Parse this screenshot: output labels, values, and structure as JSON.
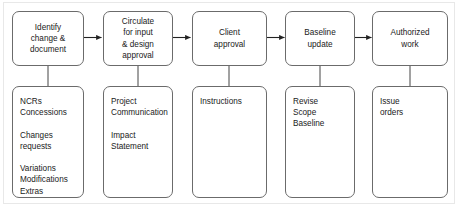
{
  "diagram": {
    "colors": {
      "box_border": "#6b6b6b",
      "connector": "#222222",
      "frame": "#e8e8e8",
      "text": "#1a1a1a",
      "background": "#ffffff"
    },
    "process_steps": [
      {
        "id": "step-1",
        "label": "Identify\nchange &\ndocument"
      },
      {
        "id": "step-2",
        "label": "Circulate\nfor input\n& design\napproval"
      },
      {
        "id": "step-3",
        "label": "Client\napproval"
      },
      {
        "id": "step-4",
        "label": "Baseline\nupdate"
      },
      {
        "id": "step-5",
        "label": "Authorized\nwork"
      }
    ],
    "detail_boxes": [
      {
        "id": "detail-1",
        "label": "NCRs\nConcessions\n\nChanges\nrequests\n\nVariations\nModifications\nExtras"
      },
      {
        "id": "detail-2",
        "label": "Project\nCommunication\n\nImpact\nStatement"
      },
      {
        "id": "detail-3",
        "label": "Instructions"
      },
      {
        "id": "detail-4",
        "label": "Revise\nScope\nBaseline"
      },
      {
        "id": "detail-5",
        "label": "Issue\norders"
      }
    ],
    "arrows": [
      {
        "id": "arrow-step1-step2",
        "from": "step-1",
        "to": "step-2"
      },
      {
        "id": "arrow-step2-step3",
        "from": "step-2",
        "to": "step-3"
      },
      {
        "id": "arrow-step3-step4",
        "from": "step-3",
        "to": "step-4"
      },
      {
        "id": "arrow-step4-step5",
        "from": "step-4",
        "to": "step-5"
      }
    ],
    "links": [
      {
        "id": "link-step1-detail1",
        "from": "step-1",
        "to": "detail-1"
      },
      {
        "id": "link-step2-detail2",
        "from": "step-2",
        "to": "detail-2"
      },
      {
        "id": "link-step3-detail3",
        "from": "step-3",
        "to": "detail-3"
      },
      {
        "id": "link-step4-detail4",
        "from": "step-4",
        "to": "detail-4"
      },
      {
        "id": "link-step5-detail5",
        "from": "step-5",
        "to": "detail-5"
      }
    ]
  }
}
